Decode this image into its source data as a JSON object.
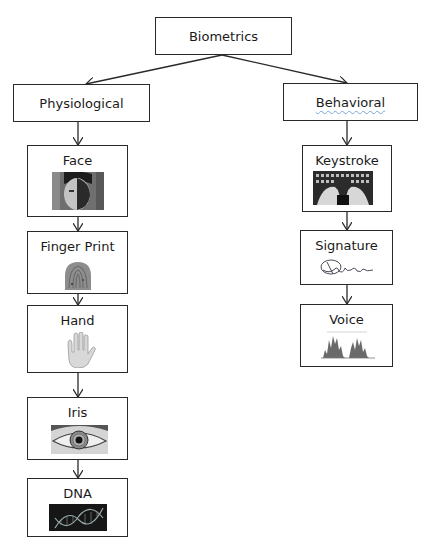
{
  "diagram": {
    "root": {
      "label": "Biometrics"
    },
    "categories": [
      {
        "label": "Physiological",
        "children": [
          {
            "label": "Face",
            "icon": "face-photo-icon"
          },
          {
            "label": "Finger Print",
            "icon": "fingerprint-icon"
          },
          {
            "label": "Hand",
            "icon": "hand-icon"
          },
          {
            "label": "Iris",
            "icon": "eye-iris-icon"
          },
          {
            "label": "DNA",
            "icon": "dna-helix-icon"
          }
        ]
      },
      {
        "label": "Behavioral",
        "children": [
          {
            "label": "Keystroke",
            "icon": "keyboard-hands-icon"
          },
          {
            "label": "Signature",
            "icon": "signature-icon"
          },
          {
            "label": "Voice",
            "icon": "voice-waveform-icon"
          }
        ]
      }
    ],
    "colors": {
      "border": "#2a2a2a",
      "text": "#1a1a1a",
      "background": "#ffffff"
    }
  }
}
